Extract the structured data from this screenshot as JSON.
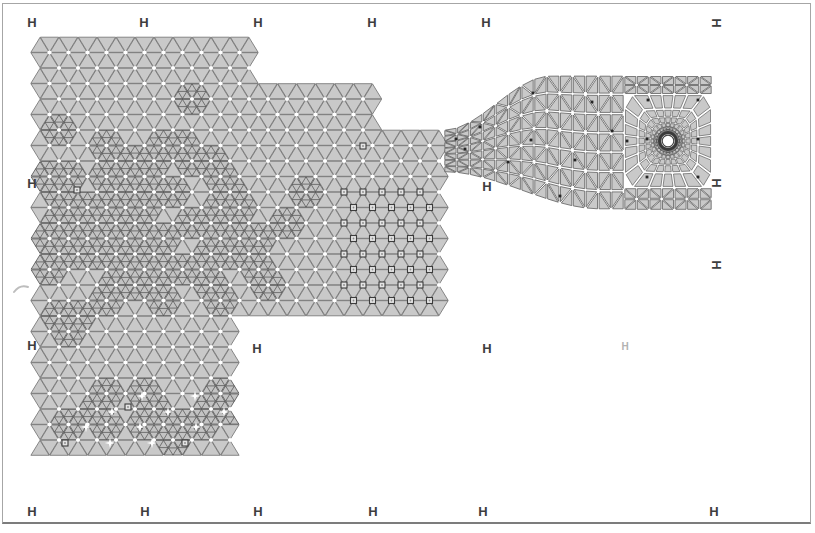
{
  "glyph": "H",
  "colors": {
    "bg": "#ffffff",
    "frame": "#a6a6a6",
    "frame_bottom": "#7c7c7c",
    "elem_fill": "#c9c9c9",
    "elem_stroke": "#7b7b7b",
    "refine_fill": "#c3c3c3",
    "refine_stroke": "#4e4e4e",
    "funnel_stroke": "#5f5f5f",
    "node_dot": "#ffffff",
    "black_dot": "#262626",
    "square_stroke": "#3c3c3c",
    "square_fill": "#e4e4e4",
    "square_center": "#8a8a8a",
    "hole_ring": "#3a3a3a",
    "mark_color": "#3e3e3e",
    "mark_faint": "#b2b2b2",
    "smudge": "#bdbdbd"
  },
  "registration_marks": [
    {
      "x": 32,
      "y": 22,
      "rot": false,
      "faint": false
    },
    {
      "x": 144,
      "y": 22,
      "rot": false,
      "faint": false
    },
    {
      "x": 258,
      "y": 22,
      "rot": false,
      "faint": false
    },
    {
      "x": 372,
      "y": 22,
      "rot": false,
      "faint": false
    },
    {
      "x": 486,
      "y": 22,
      "rot": false,
      "faint": false
    },
    {
      "x": 716,
      "y": 23,
      "rot": true,
      "faint": false
    },
    {
      "x": 32,
      "y": 183,
      "rot": false,
      "faint": false
    },
    {
      "x": 716,
      "y": 183,
      "rot": true,
      "faint": false
    },
    {
      "x": 716,
      "y": 265,
      "rot": true,
      "faint": false
    },
    {
      "x": 32,
      "y": 345,
      "rot": false,
      "faint": false
    },
    {
      "x": 257,
      "y": 348,
      "rot": false,
      "faint": false
    },
    {
      "x": 487,
      "y": 186,
      "rot": false,
      "faint": false
    },
    {
      "x": 487,
      "y": 348,
      "rot": false,
      "faint": false
    },
    {
      "x": 625,
      "y": 347,
      "rot": false,
      "faint": true
    },
    {
      "x": 32,
      "y": 511,
      "rot": false,
      "faint": false
    },
    {
      "x": 145,
      "y": 511,
      "rot": false,
      "faint": false
    },
    {
      "x": 258,
      "y": 511,
      "rot": false,
      "faint": false
    },
    {
      "x": 373,
      "y": 511,
      "rot": false,
      "faint": false
    },
    {
      "x": 483,
      "y": 511,
      "rot": false,
      "faint": false
    },
    {
      "x": 714,
      "y": 511,
      "rot": false,
      "faint": false
    }
  ],
  "smudge": {
    "x": 14,
    "y": 286
  },
  "chart_data": {
    "type": "fem-mesh",
    "canvas": {
      "w": 815,
      "h": 533
    },
    "lattice": {
      "ox": 40,
      "oy": 37,
      "dx": 19,
      "dy": 15.5
    },
    "regions": [
      {
        "name": "top-band",
        "x0": 40,
        "x1": 258,
        "y0": 36,
        "y1": 84
      },
      {
        "name": "second-band",
        "x0": 40,
        "x1": 374,
        "y0": 84,
        "y1": 131
      },
      {
        "name": "main-block",
        "x0": 40,
        "x1": 447,
        "y0": 131,
        "y1": 321
      },
      {
        "name": "lower-block",
        "x0": 40,
        "x1": 238,
        "y0": 321,
        "y1": 458
      }
    ],
    "refine_base_p": 0.02,
    "refine_zones": [
      {
        "cx": 130,
        "cy": 215,
        "rx": 105,
        "ry": 85,
        "p": 0.5
      },
      {
        "cx": 210,
        "cy": 265,
        "rx": 80,
        "ry": 60,
        "p": 0.28
      },
      {
        "cx": 80,
        "cy": 300,
        "rx": 55,
        "ry": 50,
        "p": 0.33
      },
      {
        "cx": 155,
        "cy": 420,
        "rx": 95,
        "ry": 42,
        "p": 0.42
      },
      {
        "cx": 250,
        "cy": 190,
        "rx": 60,
        "ry": 55,
        "p": 0.15
      }
    ],
    "funnel": {
      "x0": 444,
      "x1": 624,
      "cols": 14,
      "rows": 7,
      "y_top_throat": 130,
      "y_top_wide": 75,
      "x_top_end": 550,
      "y_bot_throat": 172,
      "y_bot_wide": 210,
      "x_bot_end": 600,
      "shrink": 0.82
    },
    "right_bands": {
      "x0": 624,
      "x1": 712,
      "cols": 7,
      "top": {
        "y0": 76,
        "y1": 94,
        "rows": 2
      },
      "bottom": {
        "y0": 188,
        "y1": 210,
        "rows": 2
      },
      "shrink": 0.82
    },
    "radial": {
      "cx": 668,
      "cy": 141,
      "half_w": 44,
      "half_h": 47,
      "rings": [
        7,
        10,
        13.5,
        18,
        24,
        31.5
      ],
      "sectors": 24,
      "shrink": 0.8
    },
    "hole": {
      "cx": 668,
      "cy": 141,
      "r": 5.8,
      "ring_r": 8.5,
      "ring2_r": 11.5,
      "ring3_r": 14.5
    },
    "node_dot_r": 2.1,
    "squares_grid": {
      "x0": 342,
      "x1": 431,
      "y0": 187,
      "y1": 303
    },
    "squares_extra": [
      [
        363,
        146
      ],
      [
        77,
        190
      ],
      [
        65,
        443
      ],
      [
        185,
        443
      ],
      [
        128,
        407
      ]
    ],
    "black_dots_fixed": [
      [
        533,
        93
      ],
      [
        592,
        102
      ],
      [
        480,
        127
      ],
      [
        508,
        162
      ],
      [
        560,
        196
      ],
      [
        612,
        131
      ],
      [
        648,
        100
      ],
      [
        698,
        100
      ],
      [
        647,
        139
      ],
      [
        698,
        139
      ],
      [
        647,
        177
      ],
      [
        698,
        177
      ],
      [
        627,
        141
      ],
      [
        465,
        149
      ],
      [
        531,
        140
      ],
      [
        575,
        160
      ],
      [
        456,
        139
      ]
    ],
    "black_dot_p": 0.012,
    "white_stars": [
      [
        112,
        412
      ],
      [
        140,
        427
      ],
      [
        142,
        396
      ],
      [
        168,
        412
      ],
      [
        195,
        396
      ],
      [
        196,
        427
      ],
      [
        110,
        443
      ],
      [
        224,
        412
      ],
      [
        86,
        427
      ],
      [
        152,
        443
      ]
    ]
  }
}
